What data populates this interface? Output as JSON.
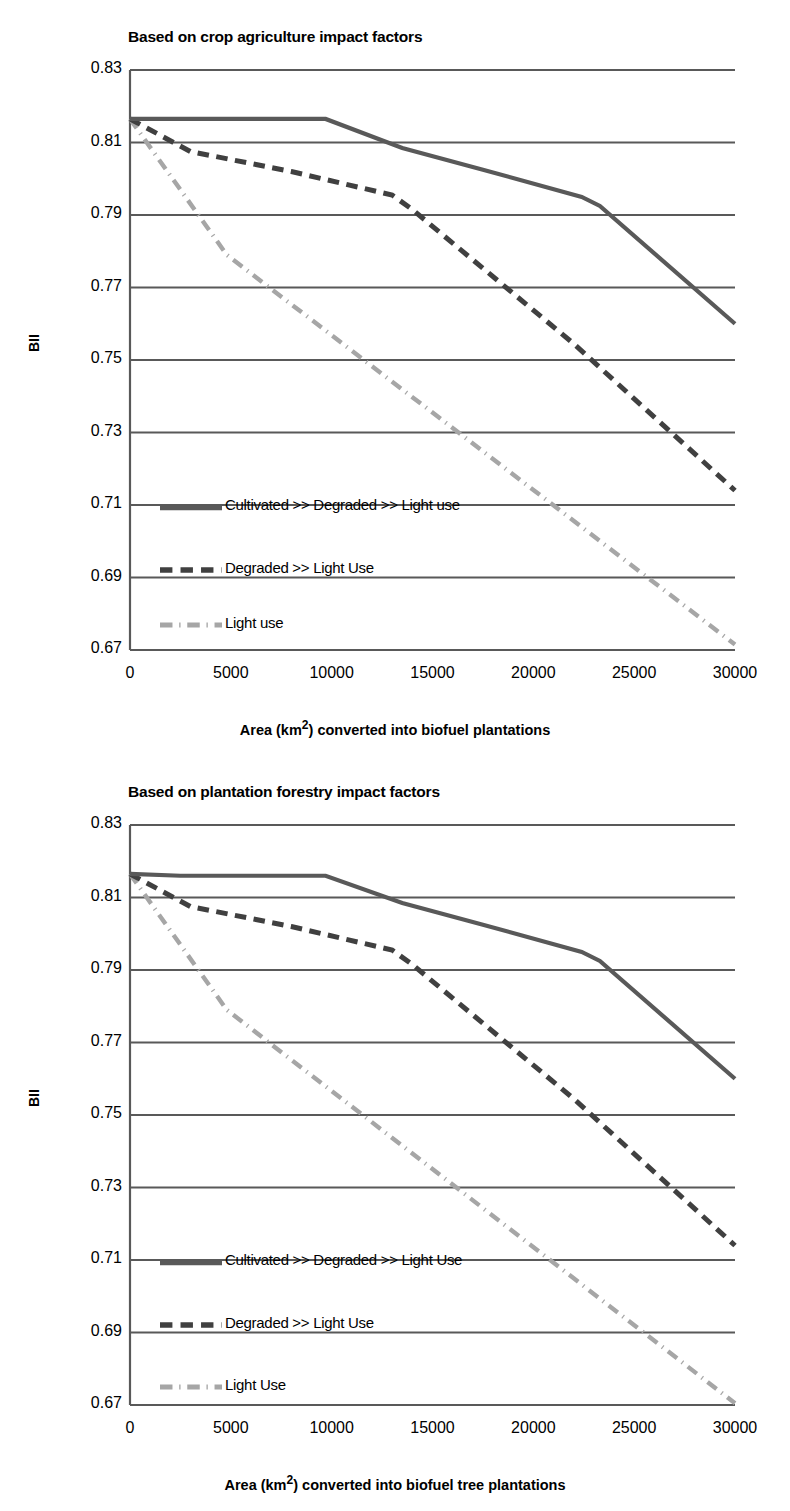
{
  "figure": {
    "background": "#ffffff",
    "axis_color": "#595959",
    "series_colors": {
      "cultivated": "#595959",
      "degraded": "#404040",
      "light": "#a6a6a6"
    }
  },
  "panels": [
    {
      "id": "top",
      "title": "Based on crop agriculture impact factors",
      "ylabel": "BII",
      "xlabel": "Area (km²) converted into biofuel plantations",
      "xlabel_parts": {
        "pre": "Area (km",
        "sup": "2",
        "post": ") converted into biofuel plantations"
      },
      "yticks": [
        "0.83",
        "0.81",
        "0.79",
        "0.77",
        "0.75",
        "0.73",
        "0.71",
        "0.69",
        "0.67"
      ],
      "xticks": [
        "0",
        "5000",
        "10000",
        "15000",
        "20000",
        "25000",
        "30000"
      ],
      "legend": [
        {
          "label": "Cultivated >> Degraded >> Light use",
          "style": "solid",
          "color": "#595959"
        },
        {
          "label": "Degraded >> Light Use",
          "style": "dashed",
          "color": "#404040"
        },
        {
          "label": "Light use",
          "style": "dashdot",
          "color": "#a6a6a6"
        }
      ]
    },
    {
      "id": "bottom",
      "title": "Based on plantation forestry impact factors",
      "ylabel": "BII",
      "xlabel": "Area (km²) converted into biofuel tree plantations",
      "xlabel_parts": {
        "pre": "Area (km",
        "sup": "2",
        "post": ") converted into biofuel tree plantations"
      },
      "yticks": [
        "0.83",
        "0.81",
        "0.79",
        "0.77",
        "0.75",
        "0.73",
        "0.71",
        "0.69",
        "0.67"
      ],
      "xticks": [
        "0",
        "5000",
        "10000",
        "15000",
        "20000",
        "25000",
        "30000"
      ],
      "legend": [
        {
          "label": "Cultivated >> Degraded >> Light Use",
          "style": "solid",
          "color": "#595959"
        },
        {
          "label": "Degraded >> Light Use",
          "style": "dashed",
          "color": "#404040"
        },
        {
          "label": "Light Use",
          "style": "dashdot",
          "color": "#a6a6a6"
        }
      ]
    }
  ],
  "chart_data": [
    {
      "type": "line",
      "title": "Based on crop agriculture impact factors",
      "xlabel": "Area (km2) converted into biofuel plantations",
      "ylabel": "BII",
      "xlim": [
        0,
        30000
      ],
      "ylim": [
        0.67,
        0.83
      ],
      "xticks": [
        0,
        5000,
        10000,
        15000,
        20000,
        25000,
        30000
      ],
      "yticks": [
        0.67,
        0.69,
        0.71,
        0.73,
        0.75,
        0.77,
        0.79,
        0.81,
        0.83
      ],
      "grid": "horizontal",
      "legend_position": "inside-lower-left",
      "series": [
        {
          "name": "Cultivated >> Degraded >> Light use",
          "style": "solid",
          "color": "#595959",
          "x": [
            0,
            2500,
            9700,
            13500,
            17500,
            22400,
            23300,
            30000
          ],
          "y": [
            0.8165,
            0.8165,
            0.8165,
            0.8085,
            0.8025,
            0.795,
            0.7925,
            0.76
          ]
        },
        {
          "name": "Degraded >> Light Use",
          "style": "dashed",
          "color": "#404040",
          "x": [
            0,
            3000,
            8000,
            13000,
            14000,
            22000,
            30000
          ],
          "y": [
            0.8165,
            0.8075,
            0.802,
            0.7955,
            0.7915,
            0.7545,
            0.714
          ]
        },
        {
          "name": "Light use",
          "style": "dashdot",
          "color": "#a6a6a6",
          "x": [
            0,
            4800,
            30000
          ],
          "y": [
            0.8165,
            0.779,
            0.6715
          ]
        }
      ]
    },
    {
      "type": "line",
      "title": "Based on plantation forestry impact factors",
      "xlabel": "Area (km2) converted into biofuel tree plantations",
      "ylabel": "BII",
      "xlim": [
        0,
        30000
      ],
      "ylim": [
        0.67,
        0.83
      ],
      "xticks": [
        0,
        5000,
        10000,
        15000,
        20000,
        25000,
        30000
      ],
      "yticks": [
        0.67,
        0.69,
        0.71,
        0.73,
        0.75,
        0.77,
        0.79,
        0.81,
        0.83
      ],
      "grid": "horizontal",
      "legend_position": "inside-lower-left",
      "series": [
        {
          "name": "Cultivated >> Degraded >> Light Use",
          "style": "solid",
          "color": "#595959",
          "x": [
            0,
            2500,
            9700,
            13500,
            17500,
            22400,
            23300,
            30000
          ],
          "y": [
            0.8165,
            0.816,
            0.816,
            0.8085,
            0.8025,
            0.795,
            0.7925,
            0.76
          ]
        },
        {
          "name": "Degraded >> Light Use",
          "style": "dashed",
          "color": "#404040",
          "x": [
            0,
            3000,
            8000,
            13000,
            14000,
            22000,
            30000
          ],
          "y": [
            0.8165,
            0.8075,
            0.802,
            0.7955,
            0.7915,
            0.7545,
            0.714
          ]
        },
        {
          "name": "Light Use",
          "style": "dashdot",
          "color": "#a6a6a6",
          "x": [
            0,
            4800,
            30000
          ],
          "y": [
            0.8165,
            0.779,
            0.6705
          ]
        }
      ]
    }
  ]
}
